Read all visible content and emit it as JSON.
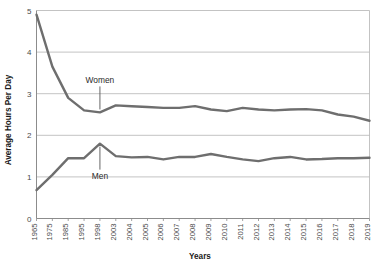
{
  "chart_data": {
    "type": "line",
    "title": "",
    "xlabel": "Years",
    "ylabel": "Average Hours Per Day",
    "ylim": [
      0,
      5
    ],
    "yticks": [
      0,
      1,
      2,
      3,
      4,
      5
    ],
    "ytick_labels": [
      "0",
      "1",
      "2",
      "3",
      "4",
      "5"
    ],
    "grid": "horizontal",
    "legend": "none",
    "categories": [
      "1965",
      "1975",
      "1985",
      "1995",
      "1998",
      "2003",
      "2004",
      "2005",
      "2006",
      "2007",
      "2008",
      "2009",
      "2010",
      "2011",
      "2012",
      "2013",
      "2014",
      "2015",
      "2016",
      "2017",
      "2018",
      "2019"
    ],
    "series": [
      {
        "name": "Women",
        "color": "#6e6e6e",
        "values": [
          4.9,
          3.65,
          2.9,
          2.6,
          2.55,
          2.72,
          2.7,
          2.68,
          2.66,
          2.66,
          2.7,
          2.62,
          2.58,
          2.66,
          2.62,
          2.6,
          2.62,
          2.63,
          2.6,
          2.5,
          2.45,
          2.35
        ]
      },
      {
        "name": "Men",
        "color": "#6e6e6e",
        "values": [
          0.68,
          1.05,
          1.45,
          1.45,
          1.8,
          1.5,
          1.47,
          1.48,
          1.42,
          1.48,
          1.48,
          1.55,
          1.48,
          1.42,
          1.38,
          1.45,
          1.48,
          1.42,
          1.43,
          1.45,
          1.45,
          1.46
        ]
      }
    ],
    "annotations": [
      {
        "text": "Women",
        "series": "Women",
        "category": "1998",
        "position": "above"
      },
      {
        "text": "Men",
        "series": "Men",
        "category": "1998",
        "position": "below"
      }
    ]
  },
  "axes": {
    "y_title": "Average Hours Per Day",
    "x_title": "Years"
  },
  "colors": {
    "line": "#6e6e6e",
    "grid": "#b4b4b4",
    "axis": "#8c8c8c",
    "text": "#2b2b2b",
    "background": "#ffffff"
  }
}
